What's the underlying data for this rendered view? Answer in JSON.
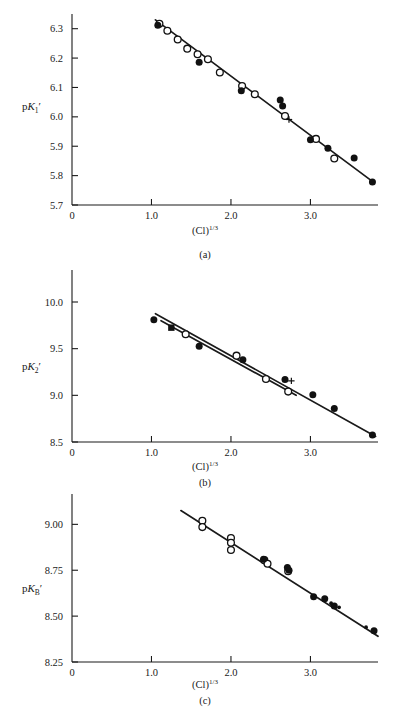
{
  "figure": {
    "axis_title": "(Cl)",
    "axis_title_exponent": "1/3",
    "panels": [
      {
        "id": "a",
        "label": "(a)",
        "ylabel_main": "p",
        "ylabel_italic": "K",
        "ylabel_sub": "1",
        "ylabel_prime": "′",
        "yticks": [
          "5.7",
          "5.8",
          "5.9",
          "6.0",
          "6.1",
          "6.2",
          "6.3"
        ],
        "xticks": [
          "0",
          "1.0",
          "2.0",
          "3.0"
        ]
      },
      {
        "id": "b",
        "label": "(b)",
        "ylabel_main": "p",
        "ylabel_italic": "K",
        "ylabel_sub": "2",
        "ylabel_prime": "′",
        "yticks": [
          "8.5",
          "9.0",
          "9.5",
          "10.0"
        ],
        "xticks": [
          "0",
          "1.0",
          "2.0",
          "3.0"
        ]
      },
      {
        "id": "c",
        "label": "(c)",
        "ylabel_main": "p",
        "ylabel_italic": "K",
        "ylabel_sub": "B",
        "ylabel_prime": "′",
        "yticks": [
          "8.25",
          "8.50",
          "8.75",
          "9.00"
        ],
        "xticks": [
          "0",
          "1.0",
          "2.0",
          "3.0"
        ]
      }
    ]
  },
  "chart_data": [
    {
      "type": "scatter",
      "panel": "a",
      "title": "",
      "xlabel": "(Cl)^1/3",
      "ylabel": "pK1'",
      "xlim": [
        0,
        3.85
      ],
      "ylim": [
        5.7,
        6.35
      ],
      "grid": false,
      "legend": "none",
      "series": [
        {
          "name": "open circles",
          "marker": "open-circle",
          "points": [
            [
              1.1,
              6.317
            ],
            [
              1.2,
              6.293
            ],
            [
              1.33,
              6.263
            ],
            [
              1.45,
              6.232
            ],
            [
              1.58,
              6.213
            ],
            [
              1.71,
              6.196
            ],
            [
              1.86,
              6.151
            ],
            [
              2.14,
              6.105
            ],
            [
              2.3,
              6.077
            ],
            [
              2.68,
              6.003
            ],
            [
              3.07,
              5.925
            ],
            [
              3.3,
              5.858
            ]
          ]
        },
        {
          "name": "filled circles",
          "marker": "filled-circle",
          "points": [
            [
              1.08,
              6.312
            ],
            [
              1.6,
              6.186
            ],
            [
              2.13,
              6.089
            ],
            [
              2.62,
              6.057
            ],
            [
              2.65,
              6.037
            ],
            [
              3.0,
              5.922
            ],
            [
              3.22,
              5.893
            ],
            [
              3.55,
              5.86
            ],
            [
              3.78,
              5.778
            ]
          ]
        },
        {
          "name": "plus marker",
          "marker": "plus",
          "points": [
            [
              2.73,
              5.991
            ]
          ]
        }
      ],
      "fit_line": {
        "x": [
          1.05,
          3.8
        ],
        "y": [
          6.33,
          5.776
        ]
      }
    },
    {
      "type": "scatter",
      "panel": "b",
      "title": "",
      "xlabel": "(Cl)^1/3",
      "ylabel": "pK2'",
      "xlim": [
        0,
        3.85
      ],
      "ylim": [
        8.5,
        10.15
      ],
      "grid": false,
      "legend": "none",
      "series": [
        {
          "name": "filled circles",
          "marker": "filled-circle",
          "points": [
            [
              1.03,
              9.81
            ],
            [
              1.6,
              9.525
            ],
            [
              2.15,
              9.38
            ],
            [
              2.68,
              9.17
            ],
            [
              3.03,
              9.005
            ],
            [
              3.3,
              8.86
            ],
            [
              3.78,
              8.575
            ]
          ]
        },
        {
          "name": "open circles",
          "marker": "open-circle",
          "points": [
            [
              1.43,
              9.655
            ],
            [
              2.07,
              9.425
            ],
            [
              2.44,
              9.175
            ],
            [
              2.72,
              9.04
            ]
          ]
        },
        {
          "name": "filled square",
          "marker": "filled-square",
          "points": [
            [
              1.25,
              9.725
            ]
          ]
        },
        {
          "name": "plus marker",
          "marker": "plus",
          "points": [
            [
              2.76,
              9.155
            ]
          ]
        }
      ],
      "fit_line": {
        "x": [
          1.05,
          3.82
        ],
        "y": [
          9.875,
          8.56
        ]
      },
      "fit_line_2": {
        "x": [
          1.12,
          2.82
        ],
        "y": [
          9.8,
          9.0
        ]
      }
    },
    {
      "type": "scatter",
      "panel": "c",
      "title": "",
      "xlabel": "(Cl)^1/3",
      "ylabel": "pKB'",
      "xlim": [
        0,
        3.85
      ],
      "ylim": [
        8.25,
        9.1
      ],
      "grid": false,
      "legend": "none",
      "series": [
        {
          "name": "open circles",
          "marker": "open-circle",
          "points": [
            [
              1.64,
              9.02
            ],
            [
              1.64,
              8.985
            ],
            [
              2.0,
              8.925
            ],
            [
              2.0,
              8.9
            ],
            [
              2.0,
              8.86
            ],
            [
              2.42,
              8.805
            ],
            [
              2.46,
              8.785
            ],
            [
              2.72,
              8.745
            ]
          ]
        },
        {
          "name": "filled circles",
          "marker": "filled-circle",
          "points": [
            [
              2.41,
              8.81
            ],
            [
              2.71,
              8.765
            ],
            [
              2.73,
              8.75
            ],
            [
              3.04,
              8.605
            ],
            [
              3.18,
              8.595
            ],
            [
              3.3,
              8.555
            ],
            [
              3.8,
              8.42
            ]
          ]
        },
        {
          "name": "small dots",
          "marker": "small-dot",
          "points": [
            [
              3.26,
              8.57
            ],
            [
              3.36,
              8.548
            ],
            [
              3.7,
              8.44
            ]
          ]
        }
      ],
      "fit_line": {
        "x": [
          1.37,
          3.85
        ],
        "y": [
          9.075,
          8.39
        ]
      }
    }
  ]
}
